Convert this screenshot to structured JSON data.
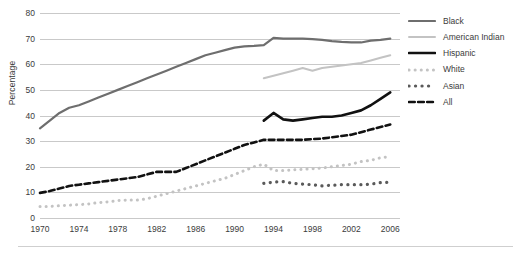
{
  "chart_data": {
    "type": "line",
    "title": "",
    "xlabel": "",
    "ylabel": "Percentage",
    "xlim": [
      1970,
      2007
    ],
    "ylim": [
      0,
      80
    ],
    "grid": true,
    "legend_position": "right",
    "yticks": [
      80,
      70,
      60,
      50,
      40,
      30,
      20,
      10,
      0
    ],
    "xticks": [
      1970,
      1974,
      1978,
      1982,
      1986,
      1990,
      1994,
      1998,
      2002,
      2006
    ],
    "series": [
      {
        "name": "Black",
        "color": "#6e6e6e",
        "style": "solid",
        "width": 2.2,
        "x": [
          1970,
          1971,
          1972,
          1973,
          1974,
          1975,
          1976,
          1977,
          1978,
          1979,
          1980,
          1981,
          1982,
          1983,
          1984,
          1985,
          1986,
          1987,
          1988,
          1989,
          1990,
          1991,
          1992,
          1993,
          1994,
          1995,
          1996,
          1997,
          1998,
          1999,
          2000,
          2001,
          2002,
          2003,
          2004,
          2005,
          2006
        ],
        "values": [
          35,
          38,
          41,
          43,
          44,
          45.5,
          47,
          48.5,
          50,
          51.5,
          53,
          54.5,
          56,
          57.5,
          59,
          60.5,
          62,
          63.5,
          64.5,
          65.5,
          66.5,
          67,
          67.2,
          67.5,
          70.3,
          70,
          70,
          70,
          69.8,
          69.5,
          69,
          68.7,
          68.5,
          68.5,
          69.2,
          69.5,
          70
        ]
      },
      {
        "name": "American Indian",
        "color": "#c3c3c3",
        "style": "solid",
        "width": 2.0,
        "x": [
          1993,
          1994,
          1995,
          1996,
          1997,
          1998,
          1999,
          2000,
          2001,
          2002,
          2003,
          2004,
          2005,
          2006
        ],
        "values": [
          54.5,
          55.5,
          56.5,
          57.5,
          58.5,
          57.5,
          58.5,
          59,
          59.5,
          60,
          60.5,
          61.5,
          62.5,
          63.5
        ]
      },
      {
        "name": "Hispanic",
        "color": "#111111",
        "style": "solid",
        "width": 2.6,
        "x": [
          1993,
          1994,
          1995,
          1996,
          1997,
          1998,
          1999,
          2000,
          2001,
          2002,
          2003,
          2004,
          2005,
          2006
        ],
        "values": [
          38,
          41,
          38.5,
          38,
          38.5,
          39,
          39.5,
          39.5,
          40,
          41,
          42,
          44,
          46.5,
          49
        ]
      },
      {
        "name": "White",
        "color": "#c3c3c3",
        "style": "dotted",
        "width": 3.0,
        "x": [
          1970,
          1971,
          1972,
          1973,
          1974,
          1975,
          1976,
          1977,
          1978,
          1979,
          1980,
          1981,
          1982,
          1983,
          1984,
          1985,
          1986,
          1987,
          1988,
          1989,
          1990,
          1991,
          1992,
          1993,
          1994,
          1995,
          1996,
          1997,
          1998,
          1999,
          2000,
          2001,
          2002,
          2003,
          2004,
          2005,
          2006
        ],
        "values": [
          4.5,
          4.5,
          4.8,
          5,
          5.2,
          5.5,
          6,
          6.3,
          6.8,
          7,
          7,
          7.5,
          8.5,
          9.5,
          10.5,
          11.5,
          12.5,
          13.5,
          14.5,
          15.5,
          17,
          18.5,
          20,
          21,
          18.5,
          18.5,
          18.8,
          19,
          19.2,
          19.5,
          20,
          20.5,
          21,
          22,
          22.5,
          23.5,
          24
        ]
      },
      {
        "name": "Asian",
        "color": "#5a5a5a",
        "style": "dotted",
        "width": 3.2,
        "x": [
          1993,
          1994,
          1995,
          1996,
          1997,
          1998,
          1999,
          2000,
          2001,
          2002,
          2003,
          2004,
          2005,
          2006
        ],
        "values": [
          13.5,
          14,
          14.2,
          13.5,
          13.2,
          13,
          12.5,
          12.8,
          13,
          13,
          13,
          13.2,
          13.8,
          14
        ]
      },
      {
        "name": "All",
        "color": "#111111",
        "style": "dashed",
        "width": 2.6,
        "x": [
          1970,
          1971,
          1972,
          1973,
          1974,
          1975,
          1976,
          1977,
          1978,
          1979,
          1980,
          1981,
          1982,
          1983,
          1984,
          1985,
          1986,
          1987,
          1988,
          1989,
          1990,
          1991,
          1992,
          1993,
          1994,
          1995,
          1996,
          1997,
          1998,
          1999,
          2000,
          2001,
          2002,
          2003,
          2004,
          2005,
          2006
        ],
        "values": [
          9.8,
          10.5,
          11.5,
          12.5,
          13,
          13.5,
          14,
          14.5,
          15,
          15.5,
          16,
          17,
          18,
          18,
          18,
          19.5,
          21,
          22.5,
          24,
          25.5,
          27,
          28.5,
          29.5,
          30.5,
          30.5,
          30.5,
          30.5,
          30.5,
          30.8,
          31,
          31.5,
          32,
          32.5,
          33.5,
          34.5,
          35.5,
          36.5
        ]
      }
    ]
  },
  "legend": {
    "items": [
      {
        "label": "Black"
      },
      {
        "label": "American Indian"
      },
      {
        "label": "Hispanic"
      },
      {
        "label": "White"
      },
      {
        "label": "Asian"
      },
      {
        "label": "All"
      }
    ]
  }
}
